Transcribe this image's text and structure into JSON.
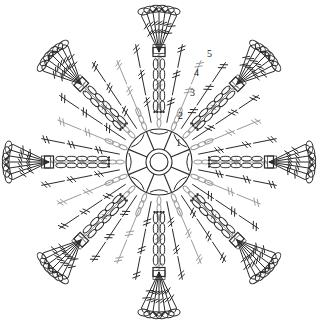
{
  "document": {
    "title": "Crochet Motif Chart",
    "type": "crochet-pattern-diagram",
    "background_color": "#ffffff",
    "width": 317,
    "height": 320
  },
  "colors": {
    "ink_dark": "#2b2b2b",
    "ink_gray": "#9a9a9a",
    "label": "#1a1a1a",
    "background": "#ffffff"
  },
  "geometry": {
    "center_x": 159,
    "center_y": 162,
    "ring_outer_r": 33,
    "ring_hub_outer_r": 13,
    "ring_hub_inner_r": 9,
    "symmetry_order": 8,
    "petal_count": 8
  },
  "round_labels": [
    {
      "text": "1",
      "x": 176,
      "y": 146
    },
    {
      "text": "2",
      "x": 178,
      "y": 119
    },
    {
      "text": "3",
      "x": 190,
      "y": 96
    },
    {
      "text": "4",
      "x": 194,
      "y": 76
    },
    {
      "text": "5",
      "x": 207,
      "y": 57
    }
  ],
  "rounds": [
    {
      "number": 1,
      "name": "center-ring-round",
      "color": "#2b2b2b",
      "description": "magic ring with 8 double crochet wedges"
    },
    {
      "number": 2,
      "name": "chain-arch-round",
      "color": "#9a9a9a",
      "description": "chain loops with picot"
    },
    {
      "number": 3,
      "name": "treble-spoke-round",
      "color": "#2b2b2b",
      "description": "treble crochet spokes"
    },
    {
      "number": 4,
      "name": "double-treble-round",
      "color": "#9a9a9a",
      "description": "double treble crochet spokes"
    },
    {
      "number": 5,
      "name": "fan-petal-round",
      "color": "#2b2b2b",
      "description": "fan shells with picot edging"
    }
  ],
  "legend": {
    "symbols": [
      {
        "name": "chain-stitch",
        "glyph": "oval"
      },
      {
        "name": "slip-stitch",
        "glyph": "dot"
      },
      {
        "name": "treble-crochet",
        "glyph": "line-with-two-bars"
      },
      {
        "name": "double-treble-crochet",
        "glyph": "line-with-three-bars"
      },
      {
        "name": "picot-loop",
        "glyph": "small-arc"
      }
    ]
  }
}
